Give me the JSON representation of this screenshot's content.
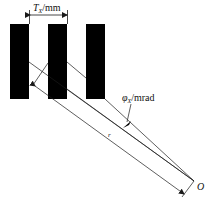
{
  "diagram": {
    "labels": {
      "pitch": "T",
      "pitch_sub": "X",
      "pitch_unit": "/mm",
      "angle": "φ",
      "angle_sub": "X",
      "angle_unit": "/mrad",
      "distance": "r",
      "origin": "O"
    },
    "bars": [
      {
        "x": 10,
        "y": 24,
        "w": 19,
        "h": 75
      },
      {
        "x": 48,
        "y": 24,
        "w": 19,
        "h": 75
      },
      {
        "x": 86,
        "y": 24,
        "w": 19,
        "h": 75
      }
    ],
    "colors": {
      "bar": "#000000",
      "line": "#1a1a1a",
      "background": "#ffffff"
    },
    "caption": ""
  }
}
